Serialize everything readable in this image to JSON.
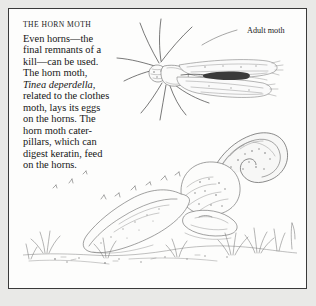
{
  "page": {
    "background_color": "#e9e9e7",
    "panel_color": "#fdfdfc",
    "border_color": "#3a3a3a",
    "ink_color": "#5d5d5d"
  },
  "title": "THE HORN MOTH",
  "body_lines": [
    {
      "text": "Even horns—the",
      "italic": false
    },
    {
      "text": "final remnants of a",
      "italic": false
    },
    {
      "text": "kill—can be used.",
      "italic": false
    },
    {
      "text": "The horn moth,",
      "italic": false
    },
    {
      "text": "Tinea deperdella,",
      "italic": true
    },
    {
      "text": "related to the clothes",
      "italic": false
    },
    {
      "text": "moth, lays its eggs",
      "italic": false
    },
    {
      "text": "on the horns. The",
      "italic": false
    },
    {
      "text": "horn moth cater-",
      "italic": false
    },
    {
      "text": "pillars, which can",
      "italic": false
    },
    {
      "text": "digest keratin, feed",
      "italic": false
    },
    {
      "text": "on the horns.",
      "italic": false
    }
  ],
  "labels": {
    "adult_moth": "Adult moth"
  },
  "illustration": {
    "adult_moth_figure": "adult-moth-drawing",
    "skull_figure": "horned-skull-drawing",
    "flying_moths_figure": "flying-moths-sketch",
    "grass_figure": "grass-tufts-sketch",
    "leader_line": "label-leader-line"
  }
}
